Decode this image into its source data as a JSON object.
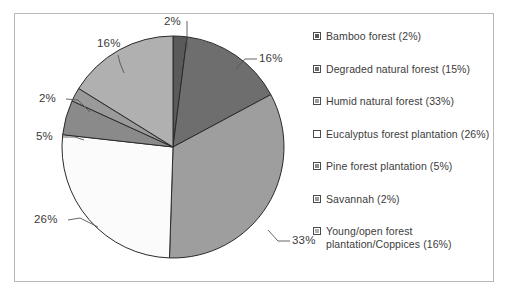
{
  "figure": {
    "frame_color": "#b9b9b9",
    "background": "#ffffff"
  },
  "chart_data": {
    "type": "pie",
    "title": "",
    "xlabel": "",
    "ylabel": "",
    "grid": false,
    "legend_position": "right",
    "start_angle_deg": 0,
    "direction": "clockwise",
    "categories": [
      "Bamboo forest",
      "Degraded natural forest",
      "Humid natural forest",
      "Eucalyptus forest plantation",
      "Pine forest plantation",
      "Savannah",
      "Young/open forest plantation/Coppices"
    ],
    "values": [
      2,
      15,
      33,
      26,
      5,
      2,
      16
    ],
    "slice_colors": [
      "#5a5a5a",
      "#6e6e6e",
      "#9e9e9e",
      "#fbfbfb",
      "#8a8a8a",
      "#9a9a9a",
      "#b0b0b0"
    ],
    "slice_edge_color": "#2a2a2a",
    "data_labels": [
      "2%",
      "16%",
      "33%",
      "26%",
      "5%",
      "2%",
      "16%"
    ]
  },
  "pie_labels": [
    {
      "text": "2%",
      "left": 162,
      "top": 14
    },
    {
      "text": "16%",
      "left": 232,
      "top": 40
    },
    {
      "text": "33%",
      "left": 264,
      "top": 222
    },
    {
      "text": "26%",
      "left": 26,
      "top": 200
    },
    {
      "text": "5%",
      "left": 26,
      "top": 119
    },
    {
      "text": "2%",
      "left": 28,
      "top": 80
    },
    {
      "text": "16%",
      "left": 85,
      "top": 28
    }
  ],
  "legend": {
    "items": [
      {
        "label": "Bamboo forest (2%)",
        "color": "#5a5a5a"
      },
      {
        "label": "Degraded natural forest (15%)",
        "color": "#6e6e6e"
      },
      {
        "label": "Humid natural forest (33%)",
        "color": "#9e9e9e"
      },
      {
        "label": "Eucalyptus forest plantation (26%)",
        "color": "#fdfdfd"
      },
      {
        "label": "Pine forest plantation (5%)",
        "color": "#8a8a8a"
      },
      {
        "label": "Savannah (2%)",
        "color": "#9a9a9a"
      },
      {
        "label": "Young/open forest plantation/Coppices (16%)",
        "color": "#b0b0b0"
      }
    ]
  }
}
